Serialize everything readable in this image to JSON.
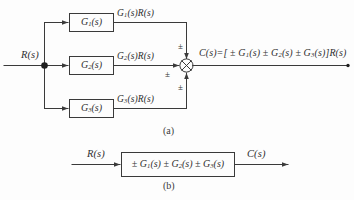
{
  "figure": {
    "type": "control-system-block-diagram",
    "background_color": "#fdfdfd",
    "line_color": "#3a3a3a",
    "text_color": "#2f2f2f",
    "captions": {
      "part_a": "(a)",
      "part_b": "(b)"
    }
  },
  "part_a": {
    "input_label": "R(s)",
    "branch_point": "takeoff-point",
    "blocks": [
      {
        "id": "g1",
        "label_main": "G",
        "label_sub": "1",
        "label_tail": "(s)",
        "plain": "G1(s)"
      },
      {
        "id": "g2",
        "label_main": "G",
        "label_sub": "2",
        "label_tail": "(s)",
        "plain": "G2(s)"
      },
      {
        "id": "g3",
        "label_main": "G",
        "label_sub": "3",
        "label_tail": "(s)",
        "plain": "G3(s)"
      }
    ],
    "branch_signals": [
      {
        "id": "sig1",
        "main": "G",
        "sub": "1",
        "tail": "(s)R(s)",
        "plain": "G1(s)R(s)"
      },
      {
        "id": "sig2",
        "main": "G",
        "sub": "2",
        "tail": "(s)R(s)",
        "plain": "G2(s)R(s)"
      },
      {
        "id": "sig3",
        "main": "G",
        "sub": "3",
        "tail": "(s)R(s)",
        "plain": "G3(s)R(s)"
      }
    ],
    "summing_junction": {
      "symbol": "circle-with-x",
      "sign_top": "±",
      "sign_middle": "±",
      "sign_bottom": "±"
    },
    "output_equation": {
      "lead": "C(s)=[ ",
      "term1_op": "±",
      "term1_main": "G",
      "term1_sub": "1",
      "term1_tail": "(s)",
      "term2_op": "±",
      "term2_main": "G",
      "term2_sub": "2",
      "term2_tail": "(s)",
      "term3_op": "±",
      "term3_main": "G",
      "term3_sub": "3",
      "term3_tail": "(s)",
      "trail": "]R(s)",
      "plain": "C(s)=[ ± G1(s) ± G2(s) ± G3(s)]R(s)"
    }
  },
  "part_b": {
    "input_label": "R(s)",
    "output_label": "C(s)",
    "block": {
      "op1": "±",
      "t1_main": "G",
      "t1_sub": "1",
      "t1_tail": "(s)",
      "op2": "±",
      "t2_main": "G",
      "t2_sub": "2",
      "t2_tail": "(s)",
      "op3": "±",
      "t3_main": "G",
      "t3_sub": "3",
      "t3_tail": "(s)",
      "plain": "± G1(s) ± G2(s) ± G3(s)"
    }
  }
}
